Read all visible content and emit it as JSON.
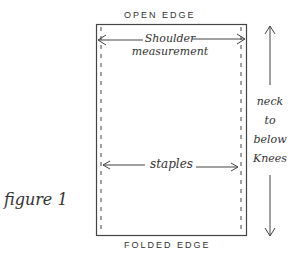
{
  "figure": {
    "caption": "figure 1",
    "labels": {
      "top_edge": "OPEN EDGE",
      "bottom_edge": "FOLDED EDGE",
      "shoulder_line1": "Shoulder",
      "shoulder_line2": "measurement",
      "staples": "staples",
      "height_line1": "neck",
      "height_line2": "to",
      "height_line3": "below",
      "height_line4": "Knees"
    },
    "colors": {
      "ink": "#333333",
      "background": "#ffffff"
    }
  }
}
